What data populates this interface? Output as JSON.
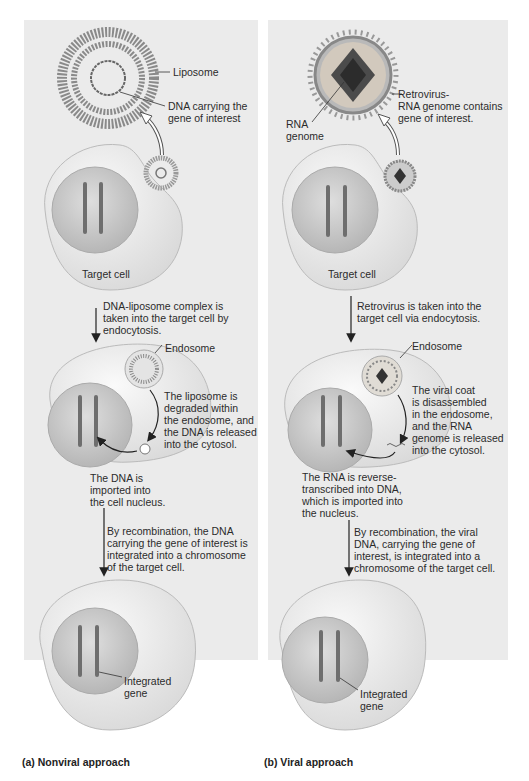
{
  "panels": {
    "nonviral": {
      "caption": "(a)  Nonviral approach",
      "labels": {
        "liposome": "Liposome",
        "dna_gene": "DNA carrying the\ngene of interest",
        "target_cell": "Target cell",
        "step1": "DNA-liposome complex is\ntaken into the target cell by\nendocytosis.",
        "endosome": "Endosome",
        "step2": "The liposome is\ndegraded within\nthe endosome, and\nthe DNA is released\ninto the cytosol.",
        "step3": "The DNA is\nimported into\nthe cell nucleus.",
        "step4": "By recombination, the DNA\ncarrying the gene of interest is\nintegrated into a chromosome\nof the target cell.",
        "integrated_gene": "Integrated\ngene"
      }
    },
    "viral": {
      "caption": "(b)  Viral approach",
      "labels": {
        "retrovirus": "Retrovirus-\nRNA genome contains\ngene of interest.",
        "rna_genome": "RNA\ngenome",
        "target_cell": "Target cell",
        "step1": "Retrovirus is taken into the\ntarget cell via endocytosis.",
        "endosome": "Endosome",
        "step2": "The viral coat\nis disassembled\nin the endosome,\nand the RNA\ngenome is released\ninto the cytosol.",
        "step3": "The RNA is reverse-\ntranscribed into DNA,\nwhich is imported into\nthe nucleus.",
        "step4": "By recombination, the viral\nDNA, carrying the gene of\ninterest, is integrated into a\nchromosome of the target cell.",
        "integrated_gene": "Integrated\ngene"
      }
    }
  },
  "colors": {
    "panel_bg": "#ebebeb",
    "cell_fill": "#f3f3f3",
    "nucleus_fill": "#cfcfcf",
    "chromosome": "#6e6e6e",
    "liposome": "#8a8a8a",
    "virus_core": "#3a3a3a"
  }
}
